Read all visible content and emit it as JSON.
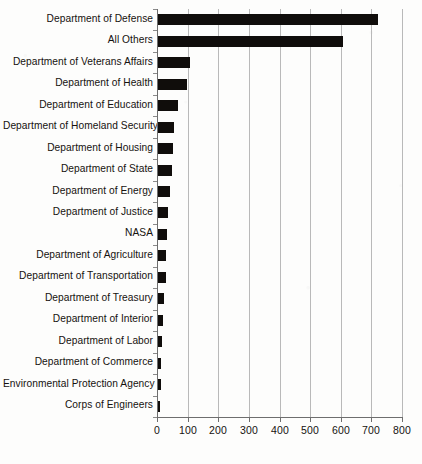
{
  "chart_data": {
    "type": "bar",
    "orientation": "horizontal",
    "title": "",
    "subtitle": "",
    "xlabel": "",
    "ylabel": "",
    "xlim": [
      0,
      800
    ],
    "ylim": null,
    "grid": true,
    "legend": null,
    "legend_position": "none",
    "xticks": [
      0,
      100,
      200,
      300,
      400,
      500,
      600,
      700,
      800
    ],
    "xtick_labels": [
      "0",
      "100",
      "200",
      "300",
      "400",
      "500",
      "600",
      "700",
      "800"
    ],
    "bar_color": "#100d0b",
    "gridline_color": "#b9b9b9",
    "axis_color": "#6e6e6e",
    "background_color": "#fdfdfc",
    "categories": [
      "Department of Defense",
      "All Others",
      "Department of Veterans Affairs",
      "Department of Health",
      "Department of Education",
      "Department of Homeland Security",
      "Department of Housing",
      "Department of State",
      "Department of Energy",
      "Department of Justice",
      "NASA",
      "Department of Agriculture",
      "Department of Transportation",
      "Department of Treasury",
      "Department of Interior",
      "Department of Labor",
      "Department of Commerce",
      "Environmental Protection Agency",
      "Corps of Engineers"
    ],
    "values": [
      722,
      608,
      108,
      98,
      70,
      55,
      52,
      48,
      43,
      36,
      33,
      30,
      29,
      23,
      20,
      16,
      12,
      12,
      10
    ]
  }
}
